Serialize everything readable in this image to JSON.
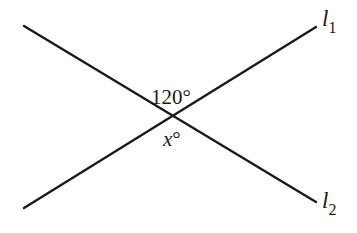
{
  "diagram": {
    "type": "intersecting-lines",
    "lines": [
      {
        "name": "l1",
        "label_base": "l",
        "label_sub": "1"
      },
      {
        "name": "l2",
        "label_base": "l",
        "label_sub": "2"
      }
    ],
    "angles": {
      "top": {
        "text": "120°",
        "value_degrees": 120
      },
      "bottom": {
        "text_var": "x",
        "text_deg": "°"
      }
    },
    "stroke_color": "#1a1a1a"
  }
}
